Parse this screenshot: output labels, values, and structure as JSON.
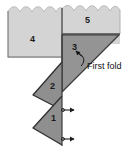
{
  "figure": {
    "panels": [
      {
        "id": "panel-1",
        "label": "1",
        "shade": "dark"
      },
      {
        "id": "panel-2",
        "label": "2",
        "shade": "dark"
      },
      {
        "id": "panel-3",
        "label": "3",
        "shade": "dark"
      },
      {
        "id": "panel-4",
        "label": "4",
        "shade": "light"
      },
      {
        "id": "panel-5",
        "label": "5",
        "shade": "light"
      }
    ],
    "annotations": [
      {
        "id": "first-fold",
        "text": "First fold"
      }
    ],
    "markers": [
      {
        "id": "fold-marker-upper"
      },
      {
        "id": "fold-marker-lower"
      }
    ],
    "colors": {
      "light_panel": "#d2d2d2",
      "dark_panel": "#8e8e8e",
      "mid_panel": "#9a9a9a",
      "outline": "#2b2b2b",
      "text": "#101010",
      "background": "#ffffff"
    }
  }
}
